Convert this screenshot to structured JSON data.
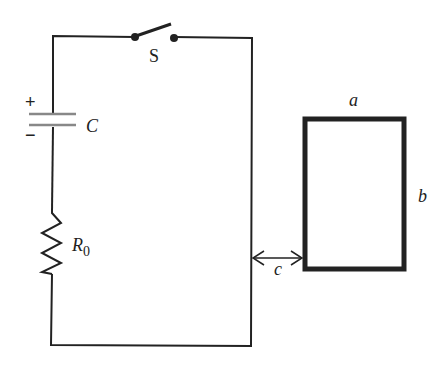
{
  "diagram": {
    "type": "circuit",
    "components": {
      "switch": {
        "label": "S"
      },
      "capacitor": {
        "label": "C",
        "plus": "+",
        "minus": "−"
      },
      "resistor": {
        "label": "R",
        "subscript": "0"
      }
    },
    "loop": {
      "width_label": "a",
      "height_label": "b"
    },
    "separation": {
      "label": "c"
    },
    "colors": {
      "wire": "#222222",
      "capacitor_plate": "#888888",
      "loop": "#222222"
    }
  }
}
